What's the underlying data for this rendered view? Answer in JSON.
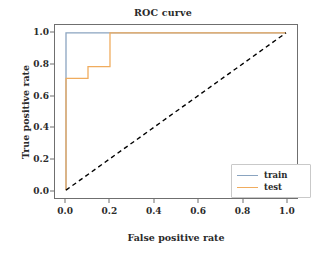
{
  "chart_data": {
    "type": "line",
    "title": "ROC curve",
    "xlabel": "False positive rate",
    "ylabel": "True positive rate",
    "xlim": [
      -0.05,
      1.05
    ],
    "ylim": [
      -0.05,
      1.05
    ],
    "grid": false,
    "legend_position": "lower right",
    "xticks": [
      "0.0",
      "0.2",
      "0.4",
      "0.6",
      "0.8",
      "1.0"
    ],
    "xtick_values": [
      0.0,
      0.2,
      0.4,
      0.6,
      0.8,
      1.0
    ],
    "yticks": [
      "0.0",
      "0.2",
      "0.4",
      "0.6",
      "0.8",
      "1.0"
    ],
    "ytick_values": [
      0.0,
      0.2,
      0.4,
      0.6,
      0.8,
      1.0
    ],
    "series": [
      {
        "name": "train",
        "color": "#8aa4c0",
        "linestyle": "solid",
        "x": [
          0.0,
          0.0,
          1.0
        ],
        "y": [
          0.0,
          1.0,
          1.0
        ]
      },
      {
        "name": "test",
        "color": "#f0ac5e",
        "linestyle": "solid",
        "x": [
          0.0,
          0.0,
          0.1,
          0.1,
          0.2,
          0.2,
          1.0
        ],
        "y": [
          0.0,
          0.71,
          0.71,
          0.785,
          0.785,
          1.0,
          1.0
        ]
      },
      {
        "name": "chance",
        "color": "#000000",
        "linestyle": "dashed",
        "x": [
          0.0,
          1.0
        ],
        "y": [
          0.0,
          1.0
        ]
      }
    ]
  },
  "legend": {
    "entries": [
      {
        "label": "train",
        "color": "#8aa4c0"
      },
      {
        "label": "test",
        "color": "#f0ac5e"
      }
    ]
  },
  "axes": {
    "frame_color": "#6f6f6f"
  }
}
